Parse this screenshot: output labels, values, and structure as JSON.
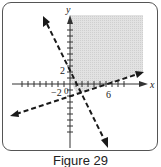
{
  "figure": {
    "caption": "Figure 29",
    "axes": {
      "x_label": "x",
      "y_label": "y",
      "origin_label": "0",
      "tick_labels": {
        "x_negative": "−2",
        "x_positive": "6",
        "y_positive": "2"
      }
    },
    "lines": [
      {
        "name": "steep-line",
        "style": "dashed",
        "description": "line through (0,2) with slope -2"
      },
      {
        "name": "shallow-line",
        "style": "dashed",
        "description": "line through (0,-2) and (6,0)"
      }
    ],
    "shaded_region": {
      "color": "#d9d9d9",
      "description": "region above both lines, first quadrant side"
    },
    "colors": {
      "line": "#1a1a1a",
      "axis": "#333333",
      "shade": "#d9d9d9",
      "frame": "#555555"
    }
  }
}
